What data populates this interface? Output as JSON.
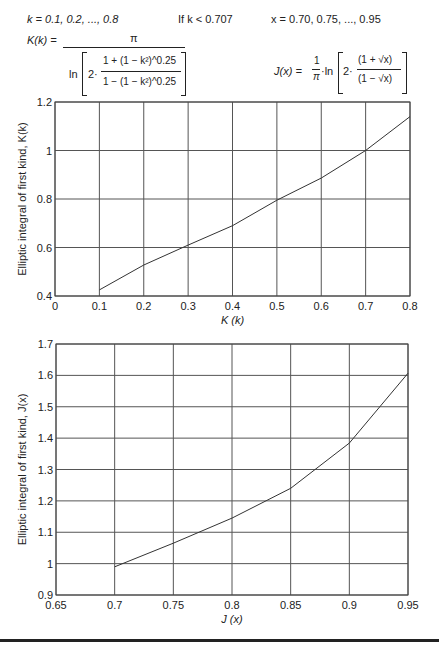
{
  "header": {
    "k_range": "k = 0.1, 0.2, ..., 0.8",
    "condition": "If k < 0.707",
    "x_range": "x = 0.70, 0.75, ..., 0.95",
    "K_formula": {
      "lhs": "K(k) =",
      "numerator": "π",
      "ln": "ln",
      "factor": "2·",
      "inner_num": "1 + (1 − k²)^0.25",
      "inner_den": "1 − (1 − k²)^0.25"
    },
    "J_formula": {
      "lhs": "J(x) =",
      "coef_num": "1",
      "coef_den": "π",
      "ln": "·ln",
      "factor": "2·",
      "inner_num": "(1 + √x)",
      "inner_den": "(1 − √x)"
    }
  },
  "chart_data": [
    {
      "type": "line",
      "title": "",
      "xlabel": "K (k)",
      "ylabel": "Elliptic integral of first kind, K(k)",
      "xlim": [
        0,
        0.8
      ],
      "ylim": [
        0.4,
        1.2
      ],
      "xticks": [
        "0",
        "0.1",
        "0.2",
        "0.3",
        "0.4",
        "0.5",
        "0.6",
        "0.7",
        "0.8"
      ],
      "yticks": [
        "0.4",
        "0.6",
        "0.8",
        "1",
        "1.2"
      ],
      "grid": true,
      "legend": "none",
      "series": [
        {
          "name": "K(k)",
          "x": [
            0.1,
            0.2,
            0.3,
            0.4,
            0.5,
            0.6,
            0.7,
            0.8
          ],
          "y": [
            0.425,
            0.528,
            0.61,
            0.69,
            0.795,
            0.886,
            1.0,
            1.14
          ]
        }
      ]
    },
    {
      "type": "line",
      "title": "",
      "xlabel": "J (x)",
      "ylabel": "Elliptic integral of first kind, J(x)",
      "xlim": [
        0.65,
        0.95
      ],
      "ylim": [
        0.9,
        1.7
      ],
      "xticks": [
        "0.65",
        "0.7",
        "0.75",
        "0.8",
        "0.85",
        "0.9",
        "0.95"
      ],
      "yticks": [
        "0.9",
        "1",
        "1.1",
        "1.2",
        "1.3",
        "1.4",
        "1.5",
        "1.6",
        "1.7"
      ],
      "grid": true,
      "legend": "none",
      "series": [
        {
          "name": "J(x)",
          "x": [
            0.7,
            0.75,
            0.8,
            0.85,
            0.9,
            0.95
          ],
          "y": [
            0.99,
            1.065,
            1.145,
            1.24,
            1.384,
            1.607
          ]
        }
      ]
    }
  ]
}
